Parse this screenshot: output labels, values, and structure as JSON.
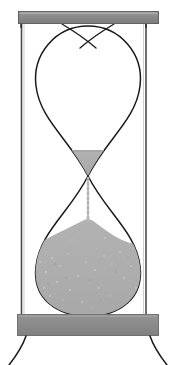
{
  "scene": {
    "title": "Hourglass",
    "subject": "sand-timer",
    "background_color": "#ffffff",
    "width": 177,
    "height": 365
  },
  "palette": {
    "background": "#ffffff",
    "frame_gray": "#8c8c8c",
    "frame_gray_dark": "#6f6f6f",
    "frame_gray_light": "#a3a3a3",
    "sand_gray": "#adadad",
    "sand_gray_dark": "#9c9c9c",
    "sand_speckle": "#c9c9c9",
    "glass_outline": "#1a1a1a",
    "post_gray": "#4a4a4a",
    "stream_gray": "#b5b5b5"
  },
  "parts": {
    "top_cap": {
      "name": "Top cap",
      "x": 18,
      "y": 11,
      "width": 141,
      "height": 13,
      "color": "#8c8c8c"
    },
    "bottom_cap": {
      "name": "Bottom cap",
      "x": 17,
      "y": 314,
      "width": 142,
      "height": 22,
      "color": "#8c8c8c"
    },
    "left_post": {
      "name": "Left post",
      "x": 21,
      "y_top": 22,
      "y_bottom": 316,
      "color": "#4a4a4a"
    },
    "right_post": {
      "name": "Right post",
      "x": 146,
      "y_top": 22,
      "y_bottom": 316,
      "color": "#4a4a4a"
    },
    "upper_bulb": {
      "name": "Upper glass bulb",
      "neck_x": 88,
      "neck_y": 176,
      "top_y": 24,
      "widest_y": 88,
      "left_x": 33,
      "right_x": 141
    },
    "lower_bulb": {
      "name": "Lower glass bulb",
      "neck_x": 88,
      "neck_y": 176,
      "bottom_y": 315,
      "widest_y": 272,
      "left_x": 35,
      "right_x": 141
    },
    "upper_sand": {
      "name": "Remaining sand in upper bulb",
      "shape": "triangle",
      "left_x": 66,
      "right_x": 110,
      "top_y": 150,
      "apex_y": 176,
      "color": "#adadad"
    },
    "lower_sand": {
      "name": "Collected sand mound in lower bulb",
      "peak_x": 88,
      "peak_y": 221,
      "base_y": 315,
      "color": "#adadad"
    },
    "sand_stream": {
      "name": "Falling sand stream",
      "x": 88,
      "y_top": 178,
      "y_bottom": 222,
      "style": "dotted",
      "color": "#b5b5b5"
    },
    "left_leg": {
      "name": "Left leg",
      "x_top": 26,
      "y_top": 336,
      "x_bottom": 10,
      "y_bottom": 365
    },
    "right_leg": {
      "name": "Right leg",
      "x_top": 150,
      "y_top": 336,
      "x_bottom": 166,
      "y_bottom": 365
    }
  },
  "labels": {
    "alt_text": "Grayscale illustration of an hourglass with sand nearly run out",
    "top_cap_label": "top-cap",
    "bottom_cap_label": "bottom-cap",
    "upper_bulb_label": "upper-bulb",
    "lower_bulb_label": "lower-bulb",
    "sand_label": "sand"
  }
}
